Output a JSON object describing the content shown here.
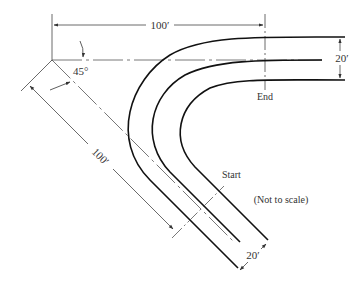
{
  "diagram": {
    "labels": {
      "top_length": "100′",
      "diag_length": "100′",
      "angle": "45°",
      "end": "End",
      "start": "Start",
      "right_width": "20′",
      "bottom_width": "20′",
      "note": "(Not to scale)"
    },
    "colors": {
      "stroke": "#1a1a1a",
      "thin": "#444444",
      "text": "#333333",
      "background": "#ffffff"
    }
  }
}
